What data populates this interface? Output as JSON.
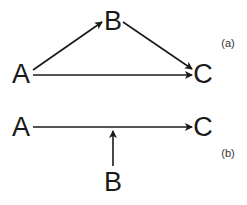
{
  "diagrams": [
    {
      "label": "(a)",
      "nodes": {
        "A": "A",
        "B": "B",
        "C": "C"
      },
      "edges": [
        [
          "A",
          "B"
        ],
        [
          "B",
          "C"
        ],
        [
          "A",
          "C"
        ]
      ]
    },
    {
      "label": "(b)",
      "nodes": {
        "A": "A",
        "B": "B",
        "C": "C"
      },
      "edges": [
        [
          "A",
          "C"
        ],
        [
          "B",
          "A->C edge"
        ]
      ]
    }
  ]
}
